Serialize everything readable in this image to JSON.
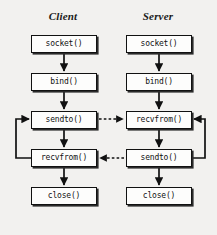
{
  "diagram": {
    "background_color": "#f2f1ef",
    "line_color": "#111111",
    "box_fill": "#fdfdfc",
    "columns": [
      {
        "key": "client",
        "label": "Client"
      },
      {
        "key": "server",
        "label": "Server"
      }
    ],
    "client": {
      "nodes": [
        {
          "id": "client-socket",
          "label": "socket()"
        },
        {
          "id": "client-bind",
          "label": "bind()"
        },
        {
          "id": "client-sendto",
          "label": "sendto()"
        },
        {
          "id": "client-recvfrom",
          "label": "recvfrom()"
        },
        {
          "id": "client-close",
          "label": "close()"
        }
      ]
    },
    "server": {
      "nodes": [
        {
          "id": "server-socket",
          "label": "socket()"
        },
        {
          "id": "server-bind",
          "label": "bind()"
        },
        {
          "id": "server-recvfrom",
          "label": "recvfrom()"
        },
        {
          "id": "server-sendto",
          "label": "sendto()"
        },
        {
          "id": "server-close",
          "label": "close()"
        }
      ]
    },
    "connections": [
      {
        "id": "client-socket-to-bind",
        "style": "solid",
        "from": "client-socket",
        "to": "client-bind"
      },
      {
        "id": "client-bind-to-sendto",
        "style": "solid",
        "from": "client-bind",
        "to": "client-sendto"
      },
      {
        "id": "client-sendto-to-recvfrom",
        "style": "solid",
        "from": "client-sendto",
        "to": "client-recvfrom"
      },
      {
        "id": "client-recvfrom-to-close",
        "style": "solid",
        "from": "client-recvfrom",
        "to": "client-close"
      },
      {
        "id": "server-socket-to-bind",
        "style": "solid",
        "from": "server-socket",
        "to": "server-bind"
      },
      {
        "id": "server-bind-to-recvfrom",
        "style": "solid",
        "from": "server-bind",
        "to": "server-recvfrom"
      },
      {
        "id": "server-recvfrom-to-sendto",
        "style": "solid",
        "from": "server-recvfrom",
        "to": "server-sendto"
      },
      {
        "id": "server-sendto-to-close",
        "style": "solid",
        "from": "server-sendto",
        "to": "server-close"
      },
      {
        "id": "data-request",
        "style": "dashed",
        "from": "client-sendto",
        "to": "server-recvfrom"
      },
      {
        "id": "data-reply",
        "style": "dashed",
        "from": "server-sendto",
        "to": "client-recvfrom"
      },
      {
        "id": "client-loop",
        "style": "solid",
        "from": "client-recvfrom",
        "to": "client-sendto"
      },
      {
        "id": "server-loop",
        "style": "solid",
        "from": "server-sendto",
        "to": "server-recvfrom"
      }
    ]
  }
}
